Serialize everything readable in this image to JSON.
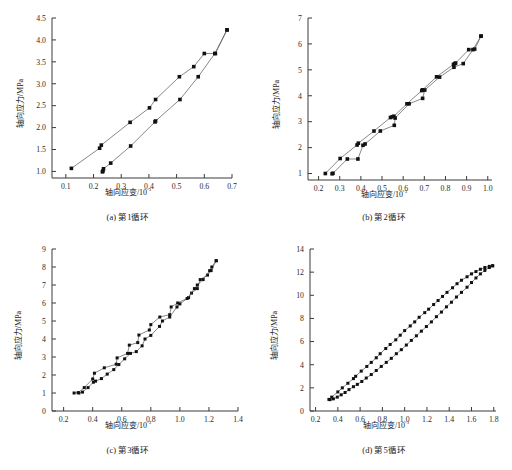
{
  "figure": {
    "panels": [
      {
        "key": "a",
        "caption": "(a) 第1循环",
        "xlabel_main": "轴向应变/10",
        "xlabel_exp": "-3",
        "ylabel": "轴向应力/MPa"
      },
      {
        "key": "b",
        "caption": "(b) 第2循环",
        "xlabel_main": "轴向应变/10",
        "xlabel_exp": "-3",
        "ylabel": "轴向应力/MPa"
      },
      {
        "key": "c",
        "caption": "(c) 第3循环",
        "xlabel_main": "轴向应变/10",
        "xlabel_exp": "-3",
        "ylabel": "轴向应力/MPa"
      },
      {
        "key": "d",
        "caption": "(d) 第5循环",
        "xlabel_main": "轴向应变/10",
        "xlabel_exp": "-3",
        "ylabel": "轴向应力/MPa"
      }
    ]
  },
  "chart_data": [
    {
      "type": "line",
      "panel": "a",
      "title": "(a) 第1循环",
      "xlabel": "轴向应变/10-3",
      "ylabel": "轴向应力/MPa",
      "xlim": [
        0.05,
        0.7
      ],
      "ylim": [
        0.85,
        4.5
      ],
      "xticks": [
        0.1,
        0.2,
        0.3,
        0.4,
        0.5,
        0.6,
        0.7
      ],
      "yticks": [
        1.0,
        1.5,
        2.0,
        2.5,
        3.0,
        3.5,
        4.0,
        4.5
      ],
      "grid": false,
      "legend": "none",
      "marker": "filled-square",
      "series": [
        {
          "name": "loading",
          "x": [
            0.12,
            0.222,
            0.228,
            0.332,
            0.402,
            0.424,
            0.51,
            0.562,
            0.6,
            0.64,
            0.682
          ],
          "y": [
            1.07,
            1.53,
            1.6,
            2.12,
            2.45,
            2.64,
            3.16,
            3.39,
            3.69,
            3.69,
            4.23
          ]
        },
        {
          "name": "unloading",
          "x": [
            0.682,
            0.638,
            0.578,
            0.512,
            0.424,
            0.422,
            0.334,
            0.262,
            0.236,
            0.234,
            0.232
          ],
          "y": [
            4.23,
            3.69,
            3.16,
            2.64,
            2.15,
            2.13,
            1.58,
            1.19,
            1.06,
            1.01,
            0.99
          ]
        }
      ]
    },
    {
      "type": "line",
      "panel": "b",
      "title": "(b) 第2循环",
      "xlabel": "轴向应变/10-3",
      "ylabel": "轴向应力/MPa",
      "xlim": [
        0.15,
        1.02
      ],
      "ylim": [
        0.75,
        7.0
      ],
      "xticks": [
        0.2,
        0.3,
        0.4,
        0.5,
        0.6,
        0.7,
        0.8,
        0.9,
        1.0
      ],
      "yticks": [
        1,
        2,
        3,
        4,
        5,
        6,
        7
      ],
      "grid": false,
      "legend": "none",
      "marker": "filled-square",
      "series": [
        {
          "name": "loading",
          "x": [
            0.232,
            0.302,
            0.382,
            0.388,
            0.462,
            0.54,
            0.548,
            0.556,
            0.618,
            0.688,
            0.692,
            0.758,
            0.838,
            0.844,
            0.848,
            0.91,
            0.938,
            0.968
          ],
          "y": [
            1.0,
            1.58,
            2.1,
            2.17,
            2.64,
            3.16,
            3.19,
            3.21,
            3.69,
            4.2,
            4.23,
            4.73,
            5.21,
            5.24,
            5.26,
            5.78,
            5.8,
            6.3
          ]
        },
        {
          "name": "unloading",
          "x": [
            0.968,
            0.93,
            0.884,
            0.84,
            0.772,
            0.702,
            0.692,
            0.628,
            0.562,
            0.558,
            0.492,
            0.42,
            0.41,
            0.386,
            0.336,
            0.268,
            0.264
          ],
          "y": [
            6.3,
            5.78,
            5.24,
            5.1,
            4.72,
            4.22,
            3.9,
            3.69,
            3.14,
            2.86,
            2.64,
            2.14,
            2.09,
            1.56,
            1.56,
            1.01,
            0.99
          ]
        }
      ]
    },
    {
      "type": "line",
      "panel": "c",
      "title": "(c) 第3循环",
      "xlabel": "轴向应变/10-3",
      "ylabel": "轴向应力/MPa",
      "xlim": [
        0.12,
        1.4
      ],
      "ylim": [
        0.0,
        9.0
      ],
      "xticks": [
        0.2,
        0.4,
        0.6,
        0.8,
        1.0,
        1.2,
        1.4
      ],
      "yticks": [
        0,
        1,
        2,
        3,
        4,
        5,
        6,
        7,
        8,
        9
      ],
      "grid": false,
      "legend": "none",
      "marker": "filled-square",
      "series": [
        {
          "name": "loading",
          "x": [
            0.272,
            0.3,
            0.342,
            0.4,
            0.412,
            0.48,
            0.562,
            0.568,
            0.64,
            0.652,
            0.71,
            0.718,
            0.79,
            0.8,
            0.862,
            0.93,
            0.94,
            0.985,
            1.06,
            1.08,
            1.12,
            1.14,
            1.19,
            1.215,
            1.25
          ],
          "y": [
            1.0,
            1.02,
            1.3,
            1.78,
            2.1,
            2.4,
            2.6,
            2.95,
            3.2,
            3.66,
            3.8,
            4.22,
            4.5,
            4.8,
            5.22,
            5.35,
            5.78,
            6.0,
            6.3,
            6.55,
            6.8,
            7.3,
            7.55,
            7.8,
            8.35
          ]
        },
        {
          "name": "unloading",
          "x": [
            1.25,
            1.22,
            1.205,
            1.16,
            1.12,
            1.1,
            1.05,
            1.0,
            0.98,
            0.93,
            0.88,
            0.86,
            0.8,
            0.76,
            0.74,
            0.7,
            0.66,
            0.62,
            0.58,
            0.545,
            0.5,
            0.46,
            0.42,
            0.405,
            0.368,
            0.33,
            0.305
          ],
          "y": [
            8.35,
            8.0,
            7.8,
            7.3,
            7.0,
            6.8,
            6.25,
            5.95,
            5.78,
            5.22,
            5.0,
            4.7,
            4.2,
            4.0,
            3.62,
            3.3,
            3.2,
            2.9,
            2.58,
            2.3,
            2.05,
            1.8,
            1.66,
            1.6,
            1.3,
            1.05,
            1.0
          ]
        }
      ]
    },
    {
      "type": "line",
      "panel": "d",
      "title": "(d) 第5循环",
      "xlabel": "轴向应变/10-3",
      "ylabel": "轴向应力/MPa",
      "xlim": [
        0.15,
        1.82
      ],
      "ylim": [
        0.0,
        14.0
      ],
      "xticks": [
        0.2,
        0.4,
        0.6,
        0.8,
        1.0,
        1.2,
        1.4,
        1.6,
        1.8
      ],
      "yticks": [
        0,
        2,
        4,
        6,
        8,
        10,
        12,
        14
      ],
      "grid": false,
      "legend": "none",
      "marker": "filled-square",
      "series": [
        {
          "name": "loading",
          "x": [
            0.32,
            0.345,
            0.4,
            0.44,
            0.49,
            0.54,
            0.56,
            0.61,
            0.66,
            0.7,
            0.745,
            0.78,
            0.83,
            0.87,
            0.92,
            0.96,
            1.0,
            1.05,
            1.09,
            1.13,
            1.18,
            1.215,
            1.26,
            1.3,
            1.34,
            1.38,
            1.43,
            1.47,
            1.51,
            1.56,
            1.6,
            1.64,
            1.68,
            1.72,
            1.76,
            1.79
          ],
          "y": [
            1.0,
            1.2,
            1.65,
            2.0,
            2.4,
            2.8,
            3.0,
            3.45,
            3.85,
            4.2,
            4.6,
            4.95,
            5.4,
            5.75,
            6.15,
            6.55,
            6.95,
            7.35,
            7.7,
            8.1,
            8.5,
            8.8,
            9.2,
            9.55,
            9.9,
            10.25,
            10.65,
            11.0,
            11.3,
            11.6,
            11.85,
            12.05,
            12.25,
            12.4,
            12.5,
            12.55
          ]
        },
        {
          "name": "unloading",
          "x": [
            1.79,
            1.76,
            1.72,
            1.68,
            1.64,
            1.6,
            1.56,
            1.51,
            1.465,
            1.42,
            1.375,
            1.33,
            1.285,
            1.24,
            1.195,
            1.15,
            1.105,
            1.06,
            1.015,
            0.97,
            0.925,
            0.88,
            0.835,
            0.79,
            0.745,
            0.7,
            0.655,
            0.615,
            0.575,
            0.54,
            0.5,
            0.465,
            0.43,
            0.395,
            0.36,
            0.33
          ],
          "y": [
            12.55,
            12.4,
            12.15,
            11.85,
            11.5,
            11.1,
            10.7,
            10.25,
            9.85,
            9.4,
            9.0,
            8.55,
            8.15,
            7.7,
            7.3,
            6.9,
            6.5,
            6.1,
            5.7,
            5.3,
            4.95,
            4.55,
            4.2,
            3.85,
            3.5,
            3.15,
            2.85,
            2.55,
            2.3,
            2.1,
            1.85,
            1.6,
            1.4,
            1.2,
            1.05,
            0.98
          ]
        }
      ]
    }
  ]
}
